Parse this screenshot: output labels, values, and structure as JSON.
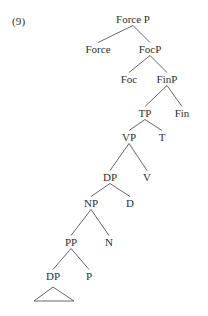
{
  "figure": {
    "example_number": "(9)",
    "type": "syntax-tree",
    "stroke_color": "#555555",
    "text_color": "#2f2f2f",
    "background_color": "#ffffff",
    "nodes": [
      {
        "id": "forceP",
        "label": "Force P",
        "x": 133,
        "y": 22,
        "level": 0
      },
      {
        "id": "force",
        "label": "Force",
        "x": 98,
        "y": 52,
        "level": 1
      },
      {
        "id": "focP",
        "label": "FocP",
        "x": 150,
        "y": 52,
        "level": 1
      },
      {
        "id": "foc",
        "label": "Foc",
        "x": 129,
        "y": 82,
        "level": 2
      },
      {
        "id": "finP",
        "label": "FinP",
        "x": 167,
        "y": 82,
        "level": 2
      },
      {
        "id": "tp",
        "label": "TP",
        "x": 145,
        "y": 116,
        "level": 3
      },
      {
        "id": "fin",
        "label": "Fin",
        "x": 182,
        "y": 116,
        "level": 3
      },
      {
        "id": "vp",
        "label": "VP",
        "x": 129,
        "y": 140,
        "level": 4
      },
      {
        "id": "t",
        "label": "T",
        "x": 162,
        "y": 140,
        "level": 4
      },
      {
        "id": "dp1",
        "label": "DP",
        "x": 110,
        "y": 180,
        "level": 5
      },
      {
        "id": "v",
        "label": "V",
        "x": 147,
        "y": 180,
        "level": 5
      },
      {
        "id": "np",
        "label": "NP",
        "x": 91,
        "y": 206,
        "level": 6
      },
      {
        "id": "d",
        "label": "D",
        "x": 130,
        "y": 206,
        "level": 6
      },
      {
        "id": "pp",
        "label": "PP",
        "x": 71,
        "y": 245,
        "level": 7
      },
      {
        "id": "n",
        "label": "N",
        "x": 109,
        "y": 245,
        "level": 7
      },
      {
        "id": "dp2",
        "label": "DP",
        "x": 53,
        "y": 279,
        "level": 8
      },
      {
        "id": "p",
        "label": "P",
        "x": 89,
        "y": 279,
        "level": 8
      }
    ],
    "branches": [
      {
        "from": "forceP",
        "to": "force"
      },
      {
        "from": "forceP",
        "to": "focP"
      },
      {
        "from": "focP",
        "to": "foc"
      },
      {
        "from": "focP",
        "to": "finP"
      },
      {
        "from": "finP",
        "to": "tp"
      },
      {
        "from": "finP",
        "to": "fin"
      },
      {
        "from": "tp",
        "to": "vp"
      },
      {
        "from": "tp",
        "to": "t"
      },
      {
        "from": "vp",
        "to": "dp1"
      },
      {
        "from": "vp",
        "to": "v"
      },
      {
        "from": "dp1",
        "to": "np"
      },
      {
        "from": "dp1",
        "to": "d"
      },
      {
        "from": "np",
        "to": "pp"
      },
      {
        "from": "np",
        "to": "n"
      },
      {
        "from": "pp",
        "to": "dp2"
      },
      {
        "from": "pp",
        "to": "p"
      }
    ],
    "triangle": {
      "under": "dp2",
      "apex_x": 53,
      "apex_y": 287,
      "left_x": 34,
      "right_x": 74,
      "base_y": 301
    }
  }
}
